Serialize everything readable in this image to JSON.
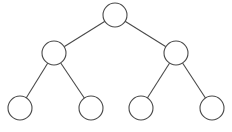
{
  "diagram": {
    "type": "binary-tree",
    "stroke_color": "#4a4a4a",
    "fill_color": "#ffffff",
    "nodes": [
      {
        "id": "root",
        "label": "",
        "level": 0,
        "index": 0
      },
      {
        "id": "left",
        "label": "",
        "level": 1,
        "index": 0
      },
      {
        "id": "right",
        "label": "",
        "level": 1,
        "index": 1
      },
      {
        "id": "left-left",
        "label": "",
        "level": 2,
        "index": 0
      },
      {
        "id": "left-right",
        "label": "",
        "level": 2,
        "index": 1
      },
      {
        "id": "right-left",
        "label": "",
        "level": 2,
        "index": 2
      },
      {
        "id": "right-right",
        "label": "",
        "level": 2,
        "index": 3
      }
    ],
    "edges": [
      {
        "from": "root",
        "to": "left"
      },
      {
        "from": "root",
        "to": "right"
      },
      {
        "from": "left",
        "to": "left-left"
      },
      {
        "from": "left",
        "to": "left-right"
      },
      {
        "from": "right",
        "to": "right-left"
      },
      {
        "from": "right",
        "to": "right-right"
      }
    ]
  }
}
